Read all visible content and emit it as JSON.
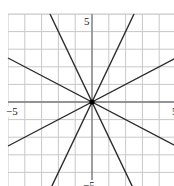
{
  "panel_label": "b",
  "chart_data": {
    "type": "line",
    "title": "",
    "xlabel": "",
    "ylabel": "",
    "xlim": [
      -5,
      5
    ],
    "ylim": [
      -5,
      5
    ],
    "grid": true,
    "grid_step": 1,
    "tick_labels": {
      "x_min": "−5",
      "x_max": "5",
      "y_max": "5",
      "y_min": "−5"
    },
    "series": [
      {
        "name": "y = 2x",
        "slope": 2,
        "intercept": 0
      },
      {
        "name": "y = -2x",
        "slope": -2,
        "intercept": 0
      },
      {
        "name": "y = 0.5x",
        "slope": 0.5,
        "intercept": 0
      },
      {
        "name": "y = -0.5x",
        "slope": -0.5,
        "intercept": 0
      }
    ],
    "annotations": [
      {
        "type": "point",
        "x": 0,
        "y": 0,
        "label": "origin (common intersection)"
      }
    ]
  },
  "colors": {
    "grid": "#c8c8c8",
    "axis": "#7a7a7a",
    "line": "#2a2a2a",
    "point": "#000000"
  }
}
